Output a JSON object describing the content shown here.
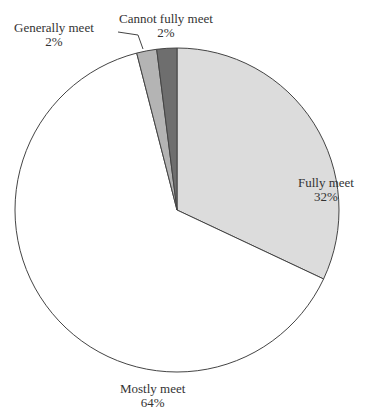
{
  "chart_data": {
    "type": "pie",
    "title": "",
    "categories": [
      "Fully meet",
      "Mostly meet",
      "Generally meet",
      "Cannot fully meet"
    ],
    "values": [
      32,
      64,
      2,
      2
    ],
    "unit": "%",
    "colors": [
      "#dcdcdc",
      "#ffffff",
      "#b4b4b4",
      "#6e6e6e"
    ],
    "labels": [
      {
        "name": "Fully meet",
        "pct": "32%"
      },
      {
        "name": "Mostly meet",
        "pct": "64%"
      },
      {
        "name": "Generally meet",
        "pct": "2%"
      },
      {
        "name": "Cannot fully meet",
        "pct": "2%"
      }
    ],
    "legend": "none (direct labels)"
  }
}
